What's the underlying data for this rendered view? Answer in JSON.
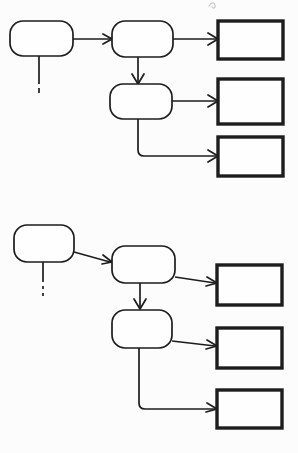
{
  "canvas": {
    "width": 298,
    "height": 453,
    "background_color": "#fcfcfc",
    "stroke_color": "#1d1d1d",
    "node_fill": "#fefefe",
    "thin_stroke_width": 1.6,
    "thick_stroke_width": 3.2
  },
  "diagram": {
    "title": "",
    "type": "flowchart",
    "group_count": 2,
    "partial_mark": {
      "name": "cropped-handwriting-mark",
      "x": 212,
      "y": 4,
      "visible_text": ""
    }
  },
  "groups": [
    {
      "id": "group-top",
      "label": "",
      "nodes": {
        "source": {
          "id": "top-source",
          "label": "",
          "shape": "rounded",
          "x": 10,
          "y": 21,
          "w": 63,
          "h": 35
        },
        "stage_a": {
          "id": "top-stage-a",
          "label": "",
          "shape": "rounded",
          "x": 112,
          "y": 21,
          "w": 61,
          "h": 36
        },
        "stage_b": {
          "id": "top-stage-b",
          "label": "",
          "shape": "rounded",
          "x": 110,
          "y": 84,
          "w": 62,
          "h": 35
        },
        "output_1": {
          "id": "top-output-1",
          "label": "",
          "shape": "rect",
          "x": 218,
          "y": 21,
          "w": 65,
          "h": 38
        },
        "output_2": {
          "id": "top-output-2",
          "label": "",
          "shape": "rect",
          "x": 218,
          "y": 79,
          "w": 65,
          "h": 45
        },
        "output_3": {
          "id": "top-output-3",
          "label": "",
          "shape": "rect",
          "x": 218,
          "y": 137,
          "w": 65,
          "h": 39
        }
      },
      "stub": {
        "id": "top-stub",
        "x": 39,
        "y_start": 56,
        "y_solid_end": 84,
        "dash_y": 89,
        "dash_len": 5
      },
      "edges": [
        {
          "id": "top-edge-source-to-a",
          "from": "source",
          "to": "stage_a",
          "kind": "arrow-right"
        },
        {
          "id": "top-edge-a-to-out1",
          "from": "stage_a",
          "to": "output_1",
          "kind": "arrow-right"
        },
        {
          "id": "top-edge-a-to-b",
          "from": "stage_a",
          "to": "stage_b",
          "kind": "arrow-down"
        },
        {
          "id": "top-edge-b-to-out2",
          "from": "stage_b",
          "to": "output_2",
          "kind": "arrow-right"
        },
        {
          "id": "top-edge-b-to-out3",
          "from": "stage_b",
          "to": "output_3",
          "kind": "elbow-down-right"
        }
      ]
    },
    {
      "id": "group-bottom",
      "label": "",
      "nodes": {
        "source": {
          "id": "bottom-source",
          "label": "",
          "shape": "rounded",
          "x": 14,
          "y": 225,
          "w": 60,
          "h": 37
        },
        "stage_a": {
          "id": "bottom-stage-a",
          "label": "",
          "shape": "rounded",
          "x": 112,
          "y": 246,
          "w": 63,
          "h": 37
        },
        "stage_b": {
          "id": "bottom-stage-b",
          "label": "",
          "shape": "rounded",
          "x": 112,
          "y": 310,
          "w": 60,
          "h": 38
        },
        "output_1": {
          "id": "bottom-output-1",
          "label": "",
          "shape": "rect",
          "x": 217,
          "y": 265,
          "w": 65,
          "h": 40
        },
        "output_2": {
          "id": "bottom-output-2",
          "label": "",
          "shape": "rect",
          "x": 217,
          "y": 328,
          "w": 65,
          "h": 40
        },
        "output_3": {
          "id": "bottom-output-3",
          "label": "",
          "shape": "rect",
          "x": 217,
          "y": 390,
          "w": 65,
          "h": 38
        }
      },
      "stub": {
        "id": "bottom-stub",
        "x": 43,
        "y_start": 262,
        "y_solid_end": 285,
        "dash_y": 291,
        "dash_len": 5
      },
      "edges": [
        {
          "id": "bottom-edge-source-to-a",
          "from": "source",
          "to": "stage_a",
          "kind": "arrow-right"
        },
        {
          "id": "bottom-edge-a-to-out1",
          "from": "stage_a",
          "to": "output_1",
          "kind": "arrow-right"
        },
        {
          "id": "bottom-edge-a-to-b",
          "from": "stage_a",
          "to": "stage_b",
          "kind": "arrow-down"
        },
        {
          "id": "bottom-edge-b-to-out2",
          "from": "stage_b",
          "to": "output_2",
          "kind": "arrow-right"
        },
        {
          "id": "bottom-edge-b-to-out3",
          "from": "stage_b",
          "to": "output_3",
          "kind": "elbow-down-right"
        }
      ]
    }
  ]
}
